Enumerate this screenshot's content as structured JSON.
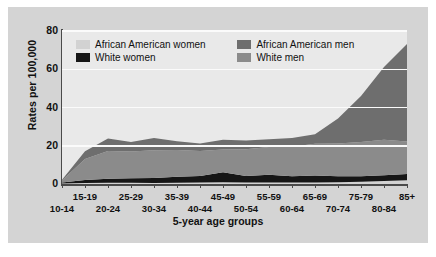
{
  "chart_data": {
    "type": "area",
    "title": "",
    "subtitle": "",
    "xlabel": "5-year age groups",
    "ylabel": "Rates per 100,000",
    "ylim": [
      0,
      80
    ],
    "yticks": [
      0,
      20,
      40,
      60,
      80
    ],
    "grid": true,
    "stacked": true,
    "legend_position": "top-inside",
    "categories": [
      "10-14",
      "15-19",
      "20-24",
      "25-29",
      "30-34",
      "35-39",
      "40-44",
      "45-49",
      "50-54",
      "55-59",
      "60-64",
      "65-69",
      "70-74",
      "75-79",
      "80-84",
      "85+"
    ],
    "series": [
      {
        "name": "African American women",
        "color": "#d2d2d2",
        "values": [
          0.2,
          0.5,
          0.6,
          0.6,
          0.5,
          0.7,
          0.8,
          0.9,
          0.8,
          0.8,
          0.8,
          0.8,
          0.9,
          1.2,
          1.6,
          2.0
        ]
      },
      {
        "name": "White women",
        "color": "#161616",
        "values": [
          0.6,
          1.6,
          2.2,
          2.4,
          2.6,
          3.1,
          3.4,
          5.2,
          3.4,
          4.0,
          3.2,
          3.6,
          3.1,
          2.8,
          3.0,
          3.2
        ]
      },
      {
        "name": "White men",
        "color": "#8b8b8b",
        "values": [
          1.0,
          11.0,
          14.5,
          14.0,
          14.5,
          14.0,
          13.0,
          12.0,
          14.0,
          14.6,
          15.5,
          16.6,
          17.2,
          18.0,
          18.6,
          17.0
        ]
      },
      {
        "name": "African American men",
        "color": "#6e6e6e",
        "values": [
          0.4,
          4.0,
          6.5,
          5.0,
          6.5,
          4.5,
          4.0,
          5.0,
          4.5,
          4.0,
          4.5,
          5.0,
          13.0,
          24.0,
          38.0,
          51.0
        ]
      }
    ],
    "totals": [
      2.2,
      17.1,
      23.8,
      22.0,
      24.1,
      22.3,
      21.2,
      23.1,
      22.7,
      23.4,
      24.0,
      26.0,
      34.2,
      46.0,
      61.2,
      73.2
    ]
  },
  "legend": {
    "items": [
      {
        "label": "African American women"
      },
      {
        "label": "African American men"
      },
      {
        "label": "White women"
      },
      {
        "label": "White men"
      }
    ]
  },
  "axis": {
    "y_title": "Rates per 100,000",
    "x_title": "5-year age groups",
    "y_labels": [
      "80",
      "60",
      "40",
      "20",
      "0"
    ],
    "x_labels_top": [
      "15-19",
      "25-29",
      "35-39",
      "45-49",
      "55-59",
      "65-69",
      "75-79",
      "85+"
    ],
    "x_labels_bottom": [
      "10-14",
      "20-24",
      "30-34",
      "40-44",
      "50-54",
      "60-64",
      "70-74",
      "80-84"
    ]
  }
}
